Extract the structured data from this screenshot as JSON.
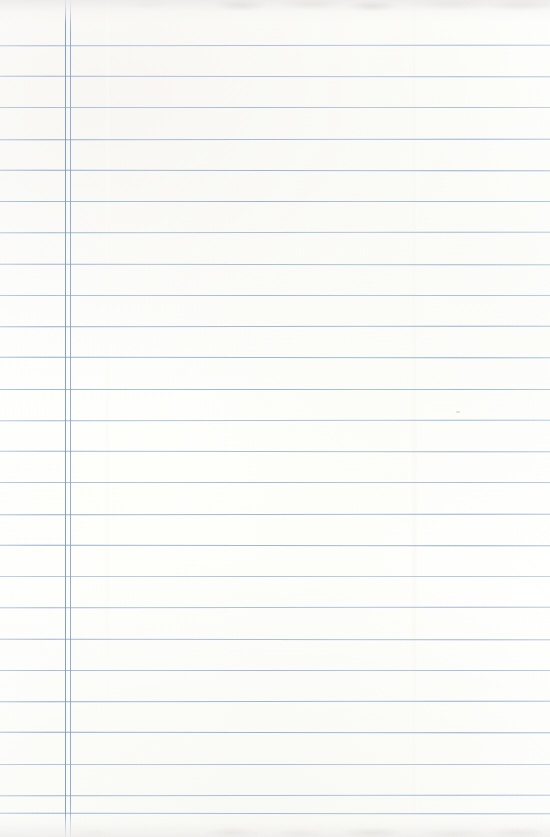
{
  "document": {
    "kind": "lined-notebook-paper-scan",
    "description": "Blank sheet of ruled notebook paper, no handwriting or printed text",
    "text_content": "",
    "page_number": "",
    "width_px": 550,
    "height_px": 837
  },
  "paper": {
    "background_color": "#fefefd",
    "tint": "#fdfdfa",
    "edge_shadow_color": "#e9e8e6"
  },
  "ruling": {
    "rule_color": "#9fb6d4",
    "rule_ink_color": "#7c9bc6",
    "line_count": 25,
    "first_line_y": 45,
    "line_spacing": 31.2,
    "rule_thickness": 1,
    "horizontal_line_y": [
      45,
      76,
      107,
      139,
      170,
      201,
      232,
      264,
      295,
      326,
      357,
      389,
      420,
      451,
      482,
      514,
      545,
      576,
      607,
      639,
      670,
      701,
      732,
      764,
      795,
      813
    ]
  },
  "margin": {
    "style": "double-vertical-rule",
    "color": "#7c9bc6",
    "inner_x": 65,
    "outer_x": 70
  },
  "scan_artifacts": {
    "vertical_band_x": 415,
    "secondary_band_x": 107,
    "speck_x": 456,
    "speck_y": 411
  }
}
